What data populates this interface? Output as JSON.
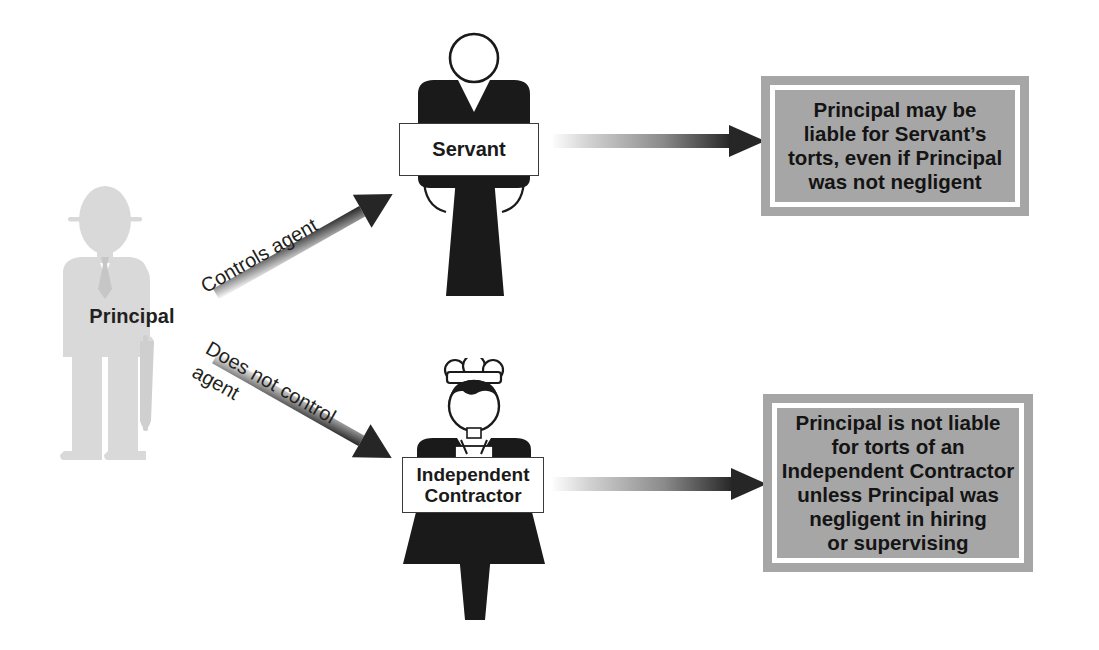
{
  "diagram": {
    "colors": {
      "principal_fill": "#d9d9d9",
      "agent_fill": "#1a1a1a",
      "callout_fill": "#a6a6a6",
      "callout_inner_border": "#ffffff",
      "callout_shadow": "#5a5a5a",
      "arrow_dark": "#2b2b2b",
      "arrow_light": "#f2f2f2",
      "text": "#231f20"
    }
  },
  "principal": {
    "label": "Principal",
    "icon": "businessman-with-umbrella-icon"
  },
  "branches": [
    {
      "id": "servant",
      "arrow_label": "Controls agent",
      "agent_label": "Servant",
      "agent_icon": "butler-servant-icon",
      "outcome_lines": [
        "Principal may be",
        "liable for Servant’s",
        "torts, even if Principal",
        "was not negligent"
      ]
    },
    {
      "id": "independent-contractor",
      "arrow_label": "Does not control\nagent",
      "agent_label_line1": "Independent",
      "agent_label_line2": "Contractor",
      "agent_icon": "chef-contractor-icon",
      "outcome_lines": [
        "Principal is not liable",
        "for torts of an",
        "Independent Contractor",
        "unless Principal was",
        "negligent in hiring",
        "or supervising"
      ]
    }
  ]
}
